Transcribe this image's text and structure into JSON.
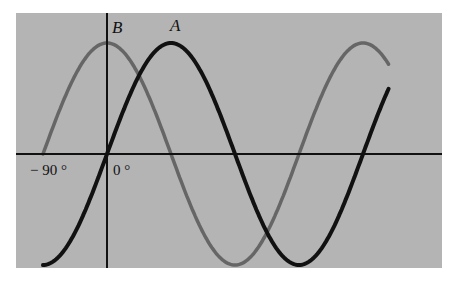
{
  "chart_data": {
    "type": "line",
    "title": "",
    "xlabel": "",
    "ylabel": "",
    "x_unit": "degrees",
    "xlim": [
      -90,
      405
    ],
    "ylim": [
      -1,
      1
    ],
    "grid": false,
    "legend": "inline labels at curve peaks",
    "tick_labels": [
      "-90°",
      "0°"
    ],
    "series": [
      {
        "name": "A",
        "function": "sin(x)",
        "color": "#111111",
        "x": [
          -90,
          -45,
          0,
          45,
          90,
          135,
          180,
          225,
          270,
          315,
          360,
          396
        ],
        "y": [
          -1,
          -0.71,
          0,
          0.71,
          1,
          0.71,
          0,
          -0.71,
          -1,
          -0.71,
          0,
          0.95
        ]
      },
      {
        "name": "B",
        "function": "cos(x)",
        "color": "#666666",
        "x": [
          -90,
          -45,
          0,
          45,
          90,
          135,
          180,
          225,
          270,
          315,
          360,
          396
        ],
        "y": [
          0,
          0.71,
          1,
          0.71,
          0,
          -0.71,
          -1,
          -0.71,
          0,
          0.71,
          1,
          0.31
        ]
      }
    ]
  },
  "labels": {
    "curve_a": "A",
    "curve_b": "B",
    "tick_neg90": "− 90 °",
    "tick_0": "0 °"
  },
  "colors": {
    "panel_background": "#b4b4b4",
    "axis": "#111111",
    "curve_a": "#111111",
    "curve_b": "#666666"
  }
}
